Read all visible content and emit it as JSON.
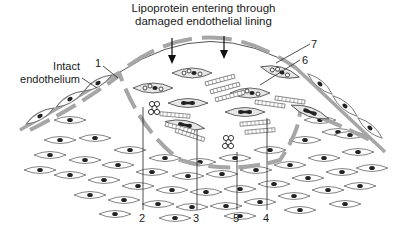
{
  "figure": {
    "title_line1": "Lipoprotein entering through",
    "title_line2": "damaged endothelial lining",
    "side_label_line1": "Intact",
    "side_label_line2": "endothelium",
    "callouts": [
      {
        "id": "1",
        "label": "1"
      },
      {
        "id": "2",
        "label": "2"
      },
      {
        "id": "3",
        "label": "3"
      },
      {
        "id": "4",
        "label": "4"
      },
      {
        "id": "5",
        "label": "5"
      },
      {
        "id": "6",
        "label": "6"
      },
      {
        "id": "7",
        "label": "7"
      }
    ],
    "colors": {
      "line": "#333333",
      "membrane": "#a6a6a6",
      "cell_fill": "#e6e6e6",
      "nucleus": "#222222"
    }
  }
}
